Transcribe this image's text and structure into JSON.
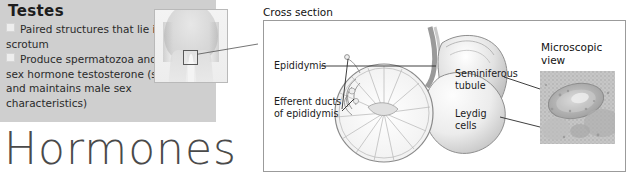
{
  "left_panel": {
    "title": "Testes",
    "bullets": [
      "Paired structures that lie in the scrotum",
      "Produce spermatozoa and the male sex hormone testosterone (stimulates and maintains male sex characteristics)"
    ],
    "background_color": "#cfcfcf",
    "bullet_marker": "filled-square"
  },
  "body_photo": {
    "name": "male-pelvis-photo",
    "highlight_region": "scrotum-detail-box"
  },
  "page_title": "Hormones",
  "page_title_color": "#4a4a4a",
  "cross_section": {
    "caption": "Cross section",
    "labels": {
      "epididymis": "Epididymis",
      "efferent_ducts": "Efferent ducts\nof epididymis"
    },
    "illustration": "testis-cross-section"
  },
  "microscopic": {
    "caption": "Microscopic\nview",
    "labels": {
      "seminiferous_tubule": "Seminiferous\ntubule",
      "leydig_cells": "Leydig\ncells"
    },
    "image": "seminiferous-tubule-micrograph"
  }
}
